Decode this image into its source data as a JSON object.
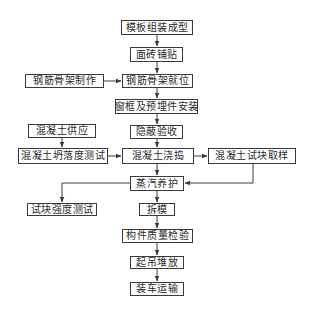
{
  "diagram": {
    "type": "flowchart",
    "line_color": "#3a3a3a",
    "nodes": [
      {
        "id": "formwork",
        "label": "模板组装成型",
        "x": 121,
        "y": 20,
        "w": 72,
        "h": 15
      },
      {
        "id": "tile",
        "label": "面砖铺贴",
        "x": 130,
        "y": 47,
        "w": 53,
        "h": 15
      },
      {
        "id": "rebar_make",
        "label": "钢筋骨架制作",
        "x": 25,
        "y": 74,
        "w": 79,
        "h": 14
      },
      {
        "id": "rebar_place",
        "label": "钢筋骨架就位",
        "x": 122,
        "y": 74,
        "w": 71,
        "h": 14
      },
      {
        "id": "window",
        "label": "窗框及预埋件安装",
        "x": 115,
        "y": 99,
        "w": 83,
        "h": 15
      },
      {
        "id": "inspect_hidden",
        "label": "隐蔽验收",
        "x": 130,
        "y": 125,
        "w": 53,
        "h": 14
      },
      {
        "id": "concrete_supply",
        "label": "混凝土供应",
        "x": 28,
        "y": 124,
        "w": 68,
        "h": 14
      },
      {
        "id": "slump_test",
        "label": "混凝土坍落度测试",
        "x": 18,
        "y": 148,
        "w": 90,
        "h": 16
      },
      {
        "id": "pour",
        "label": "混凝土浇捣",
        "x": 122,
        "y": 148,
        "w": 72,
        "h": 16
      },
      {
        "id": "sample",
        "label": "混凝土试块取样",
        "x": 208,
        "y": 148,
        "w": 88,
        "h": 16
      },
      {
        "id": "steam",
        "label": "蒸汽养护",
        "x": 130,
        "y": 176,
        "w": 54,
        "h": 15
      },
      {
        "id": "strength_test",
        "label": "试块强度测试",
        "x": 27,
        "y": 203,
        "w": 70,
        "h": 13
      },
      {
        "id": "demold",
        "label": "拆模",
        "x": 139,
        "y": 203,
        "w": 36,
        "h": 13
      },
      {
        "id": "quality",
        "label": "构件质量检验",
        "x": 122,
        "y": 229,
        "w": 71,
        "h": 14
      },
      {
        "id": "lift_stack",
        "label": "起吊堆放",
        "x": 130,
        "y": 256,
        "w": 54,
        "h": 13
      },
      {
        "id": "transport",
        "label": "装车运输",
        "x": 130,
        "y": 282,
        "w": 54,
        "h": 14
      }
    ],
    "edges": [
      {
        "from": "formwork",
        "to": "tile"
      },
      {
        "from": "tile",
        "to": "rebar_place"
      },
      {
        "from": "rebar_make",
        "to": "rebar_place"
      },
      {
        "from": "rebar_place",
        "to": "window"
      },
      {
        "from": "window",
        "to": "inspect_hidden"
      },
      {
        "from": "inspect_hidden",
        "to": "pour"
      },
      {
        "from": "concrete_supply",
        "to": "slump_test"
      },
      {
        "from": "slump_test",
        "to": "pour"
      },
      {
        "from": "pour",
        "to": "sample"
      },
      {
        "from": "pour",
        "to": "steam"
      },
      {
        "from": "sample",
        "to": "steam"
      },
      {
        "from": "steam",
        "to": "strength_test"
      },
      {
        "from": "steam",
        "to": "demold"
      },
      {
        "from": "demold",
        "to": "quality"
      },
      {
        "from": "quality",
        "to": "lift_stack"
      },
      {
        "from": "lift_stack",
        "to": "transport"
      }
    ]
  }
}
